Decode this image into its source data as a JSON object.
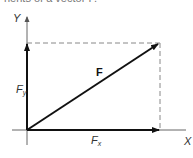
{
  "caption": "nents of a vector F.",
  "diagram": {
    "axes": {
      "x_label": "X",
      "y_label": "Y"
    },
    "vector": {
      "label": "F"
    },
    "components": [
      {
        "name": "Fx",
        "symbol": "F",
        "subscript": "x"
      },
      {
        "name": "Fy",
        "symbol": "F",
        "subscript": "y"
      }
    ],
    "colors": {
      "axis": "#666666",
      "arrow": "#111111",
      "dashed": "#888888"
    }
  }
}
